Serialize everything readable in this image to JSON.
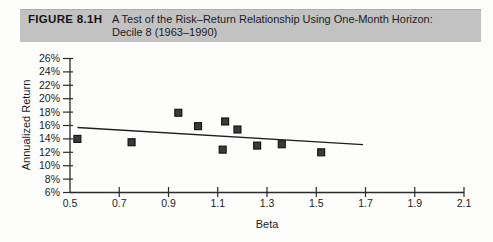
{
  "header": {
    "figure_label": "FIGURE 8.1H",
    "title_line1": "A Test of the Risk–Return Relationship Using One-Month Horizon:",
    "title_line2": "Decile 8 (1963–1990)"
  },
  "colors": {
    "header_bg": "#c2c2c2",
    "axis": "#2b2b2b",
    "tick_text": "#1c1c1c",
    "marker_fill": "#3a3a3a",
    "marker_stroke": "#101010",
    "trend_line": "#1f1f1f"
  },
  "chart_data": {
    "type": "scatter",
    "title": "A Test of the Risk–Return Relationship Using One-Month Horizon: Decile 8 (1963–1990)",
    "xlabel": "Beta",
    "ylabel": "Annualized Return",
    "xlim": [
      0.5,
      2.1
    ],
    "ylim": [
      6,
      26
    ],
    "grid": false,
    "legend": false,
    "x_ticks": [
      {
        "value": 0.5,
        "label": "0.5"
      },
      {
        "value": 0.7,
        "label": "0.7"
      },
      {
        "value": 0.9,
        "label": "0.9"
      },
      {
        "value": 1.1,
        "label": "1.1"
      },
      {
        "value": 1.3,
        "label": "1.3"
      },
      {
        "value": 1.5,
        "label": "1.5"
      },
      {
        "value": 1.7,
        "label": "1.7"
      },
      {
        "value": 1.9,
        "label": "1.9"
      },
      {
        "value": 2.1,
        "label": "2.1"
      }
    ],
    "y_ticks": [
      {
        "value": 6,
        "label": "6%"
      },
      {
        "value": 8,
        "label": "8%"
      },
      {
        "value": 10,
        "label": "10%"
      },
      {
        "value": 12,
        "label": "12%"
      },
      {
        "value": 14,
        "label": "14%"
      },
      {
        "value": 16,
        "label": "16%"
      },
      {
        "value": 18,
        "label": "18%"
      },
      {
        "value": 20,
        "label": "20%"
      },
      {
        "value": 22,
        "label": "22%"
      },
      {
        "value": 24,
        "label": "24%"
      },
      {
        "value": 26,
        "label": "26%"
      }
    ],
    "points": [
      {
        "beta": 0.53,
        "annualized_return": 14.0
      },
      {
        "beta": 0.75,
        "annualized_return": 13.5
      },
      {
        "beta": 0.94,
        "annualized_return": 17.9
      },
      {
        "beta": 1.02,
        "annualized_return": 15.9
      },
      {
        "beta": 1.12,
        "annualized_return": 12.4
      },
      {
        "beta": 1.13,
        "annualized_return": 16.6
      },
      {
        "beta": 1.18,
        "annualized_return": 15.4
      },
      {
        "beta": 1.26,
        "annualized_return": 13.0
      },
      {
        "beta": 1.36,
        "annualized_return": 13.2
      },
      {
        "beta": 1.52,
        "annualized_return": 12.0
      }
    ],
    "trend_line": {
      "x1": 0.53,
      "y1": 15.7,
      "x2": 1.69,
      "y2": 13.15
    }
  }
}
